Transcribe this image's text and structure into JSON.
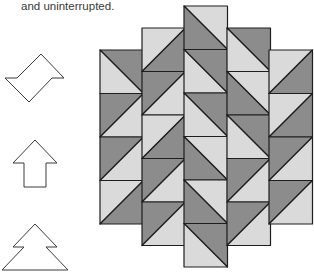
{
  "caption": "and uninterrupted.",
  "colors": {
    "dark": "#8c8c8c",
    "light": "#dadada",
    "stroke": "#1e1e1e",
    "outline": "#3a3a3a"
  },
  "shapes": [
    {
      "name": "zigzag-parallelogram-shape"
    },
    {
      "name": "up-arrow-shape"
    },
    {
      "name": "tree-shape"
    }
  ],
  "quilt": {
    "columns": [
      {
        "squares": [
          {
            "diagonal": "tl-br",
            "dark": "tr"
          },
          {
            "diagonal": "bl-tr",
            "dark": "tl"
          },
          {
            "diagonal": "bl-tr",
            "dark": "tl"
          },
          {
            "diagonal": "bl-tr",
            "dark": "br"
          }
        ]
      },
      {
        "squares": [
          {
            "diagonal": "bl-tr",
            "dark": "br"
          },
          {
            "diagonal": "bl-tr",
            "dark": "tl"
          },
          {
            "diagonal": "bl-tr",
            "dark": "br"
          },
          {
            "diagonal": "bl-tr",
            "dark": "tl"
          },
          {
            "diagonal": "bl-tr",
            "dark": "tl"
          }
        ]
      },
      {
        "squares": [
          {
            "diagonal": "tl-br",
            "dark": "bl"
          },
          {
            "diagonal": "tl-br",
            "dark": "tr"
          },
          {
            "diagonal": "tl-br",
            "dark": "tr"
          },
          {
            "diagonal": "tl-br",
            "dark": "bl"
          },
          {
            "diagonal": "tl-br",
            "dark": "bl"
          },
          {
            "diagonal": "tl-br",
            "dark": "tr"
          }
        ]
      },
      {
        "squares": [
          {
            "diagonal": "tl-br",
            "dark": "tr"
          },
          {
            "diagonal": "tl-br",
            "dark": "bl"
          },
          {
            "diagonal": "tl-br",
            "dark": "tr"
          },
          {
            "diagonal": "bl-tr",
            "dark": "tl"
          },
          {
            "diagonal": "bl-tr",
            "dark": "tl"
          }
        ]
      },
      {
        "squares": [
          {
            "diagonal": "bl-tr",
            "dark": "br"
          },
          {
            "diagonal": "bl-tr",
            "dark": "br"
          },
          {
            "diagonal": "bl-tr",
            "dark": "tl"
          },
          {
            "diagonal": "bl-tr",
            "dark": "tl"
          }
        ]
      }
    ]
  }
}
